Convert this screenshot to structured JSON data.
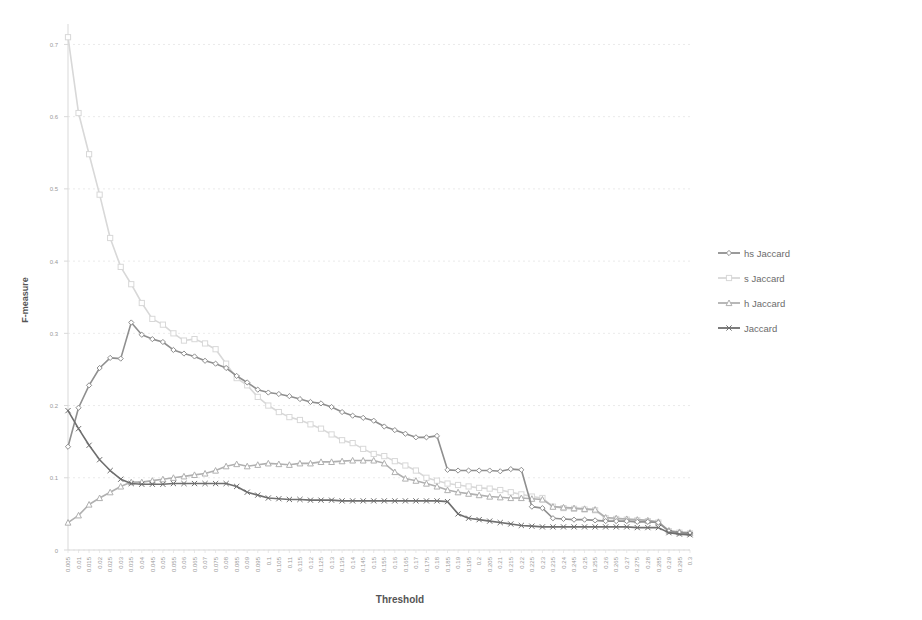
{
  "chart_data": {
    "type": "line",
    "title": "",
    "xlabel": "Threshold",
    "ylabel": "F-measure",
    "ylim": [
      0,
      0.72
    ],
    "yticks": [
      0,
      0.1,
      0.2,
      0.3,
      0.4,
      0.5,
      0.6,
      0.7
    ],
    "ytick_labels": [
      "0",
      "0.1",
      "0.2",
      "0.3",
      "0.4",
      "0.5",
      "0.6",
      "0.7"
    ],
    "grid": true,
    "grid_axis": "y",
    "legend_position": "right",
    "x": [
      0.005,
      0.01,
      0.015,
      0.02,
      0.025,
      0.03,
      0.035,
      0.04,
      0.045,
      0.05,
      0.055,
      0.06,
      0.065,
      0.07,
      0.075,
      0.08,
      0.085,
      0.09,
      0.095,
      0.1,
      0.105,
      0.11,
      0.115,
      0.12,
      0.125,
      0.13,
      0.135,
      0.14,
      0.145,
      0.15,
      0.155,
      0.16,
      0.165,
      0.17,
      0.175,
      0.18,
      0.185,
      0.19,
      0.195,
      0.2,
      0.205,
      0.21,
      0.215,
      0.22,
      0.225,
      0.23,
      0.235,
      0.24,
      0.245,
      0.25,
      0.255,
      0.26,
      0.265,
      0.27,
      0.275,
      0.28,
      0.285,
      0.29,
      0.295,
      0.3
    ],
    "xtick_labels": [
      "0.005",
      "0.01",
      "0.015",
      "0.02",
      "0.025",
      "0.03",
      "0.035",
      "0.04",
      "0.045",
      "0.05",
      "0.055",
      "0.06",
      "0.065",
      "0.07",
      "0.075",
      "0.08",
      "0.085",
      "0.09",
      "0.095",
      "0.1",
      "0.105",
      "0.11",
      "0.115",
      "0.12",
      "0.125",
      "0.13",
      "0.135",
      "0.14",
      "0.145",
      "0.15",
      "0.155",
      "0.16",
      "0.165",
      "0.17",
      "0.175",
      "0.18",
      "0.185",
      "0.19",
      "0.195",
      "0.2",
      "0.205",
      "0.21",
      "0.215",
      "0.22",
      "0.225",
      "0.23",
      "0.235",
      "0.24",
      "0.245",
      "0.25",
      "0.255",
      "0.26",
      "0.265",
      "0.27",
      "0.275",
      "0.28",
      "0.285",
      "0.29",
      "0.295",
      "0.3"
    ],
    "series": [
      {
        "name": "hs Jaccard",
        "color": "#8f8f8f",
        "marker": "diamond",
        "values": [
          0.143,
          0.197,
          0.228,
          0.252,
          0.266,
          0.265,
          0.315,
          0.298,
          0.292,
          0.288,
          0.277,
          0.272,
          0.268,
          0.262,
          0.258,
          0.252,
          0.241,
          0.232,
          0.222,
          0.218,
          0.216,
          0.213,
          0.209,
          0.205,
          0.203,
          0.198,
          0.191,
          0.186,
          0.183,
          0.179,
          0.171,
          0.166,
          0.161,
          0.156,
          0.156,
          0.158,
          0.111,
          0.11,
          0.11,
          0.11,
          0.11,
          0.109,
          0.112,
          0.111,
          0.06,
          0.058,
          0.044,
          0.043,
          0.042,
          0.042,
          0.041,
          0.04,
          0.04,
          0.04,
          0.039,
          0.039,
          0.038,
          0.026,
          0.024,
          0.023
        ]
      },
      {
        "name": "s Jaccard",
        "color": "#d8d8d8",
        "marker": "square",
        "values": [
          0.71,
          0.605,
          0.548,
          0.492,
          0.432,
          0.392,
          0.368,
          0.342,
          0.32,
          0.312,
          0.3,
          0.29,
          0.292,
          0.286,
          0.278,
          0.258,
          0.238,
          0.228,
          0.212,
          0.2,
          0.191,
          0.184,
          0.18,
          0.174,
          0.168,
          0.16,
          0.152,
          0.148,
          0.14,
          0.133,
          0.13,
          0.123,
          0.117,
          0.11,
          0.1,
          0.096,
          0.092,
          0.09,
          0.088,
          0.086,
          0.085,
          0.083,
          0.08,
          0.077,
          0.074,
          0.072,
          0.06,
          0.058,
          0.057,
          0.056,
          0.055,
          0.044,
          0.043,
          0.042,
          0.041,
          0.04,
          0.038,
          0.026,
          0.024,
          0.023
        ]
      },
      {
        "name": "h Jaccard",
        "color": "#b0b0b0",
        "marker": "triangle",
        "values": [
          0.038,
          0.048,
          0.063,
          0.072,
          0.08,
          0.088,
          0.094,
          0.094,
          0.096,
          0.098,
          0.1,
          0.102,
          0.104,
          0.106,
          0.11,
          0.116,
          0.119,
          0.116,
          0.118,
          0.12,
          0.119,
          0.118,
          0.12,
          0.12,
          0.122,
          0.122,
          0.123,
          0.124,
          0.124,
          0.124,
          0.12,
          0.108,
          0.099,
          0.096,
          0.092,
          0.088,
          0.083,
          0.08,
          0.078,
          0.076,
          0.074,
          0.073,
          0.072,
          0.072,
          0.071,
          0.07,
          0.06,
          0.059,
          0.058,
          0.057,
          0.056,
          0.045,
          0.044,
          0.043,
          0.042,
          0.041,
          0.039,
          0.027,
          0.025,
          0.024
        ]
      },
      {
        "name": "Jaccard",
        "color": "#6e6e6e",
        "marker": "cross",
        "values": [
          0.193,
          0.168,
          0.145,
          0.125,
          0.11,
          0.098,
          0.092,
          0.091,
          0.091,
          0.091,
          0.092,
          0.092,
          0.092,
          0.092,
          0.092,
          0.092,
          0.088,
          0.08,
          0.076,
          0.072,
          0.071,
          0.07,
          0.07,
          0.069,
          0.069,
          0.069,
          0.068,
          0.068,
          0.068,
          0.068,
          0.068,
          0.068,
          0.068,
          0.068,
          0.068,
          0.068,
          0.067,
          0.05,
          0.044,
          0.042,
          0.04,
          0.038,
          0.036,
          0.034,
          0.033,
          0.032,
          0.032,
          0.032,
          0.032,
          0.032,
          0.032,
          0.032,
          0.032,
          0.032,
          0.031,
          0.031,
          0.031,
          0.024,
          0.022,
          0.021
        ]
      }
    ]
  },
  "legend": {
    "items": [
      {
        "label": "hs Jaccard"
      },
      {
        "label": "s Jaccard"
      },
      {
        "label": "h Jaccard"
      },
      {
        "label": "Jaccard"
      }
    ]
  }
}
